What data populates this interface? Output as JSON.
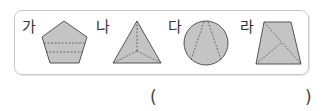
{
  "question": {
    "choices": [
      {
        "label": "가",
        "shape": "pentagon",
        "description": "pentagon split by two horizontal dashed lines"
      },
      {
        "label": "나",
        "shape": "triangle",
        "description": "triangle with dashed lines from center to each vertex"
      },
      {
        "label": "다",
        "shape": "circle",
        "description": "circle with two dashed chords meeting at top"
      },
      {
        "label": "라",
        "shape": "trapezoid",
        "description": "trapezoid with two dashed diagonal lines"
      }
    ],
    "answer_open": "(",
    "answer_close": ")",
    "answer_value": ""
  },
  "colors": {
    "fill": "#c4c4c4",
    "stroke": "#555555",
    "border": "#c9c9c9"
  }
}
